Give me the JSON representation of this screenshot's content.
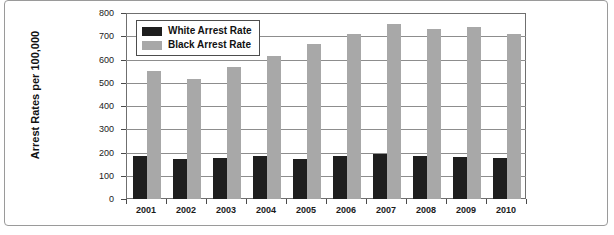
{
  "chart_data": {
    "type": "bar",
    "title": "",
    "xlabel": "",
    "ylabel": "Arrest Rates per 100,000",
    "ylim": [
      0,
      800
    ],
    "ytick_step": 100,
    "yticks": [
      "0",
      "100",
      "200",
      "300",
      "400",
      "500",
      "600",
      "700",
      "800"
    ],
    "grid": true,
    "legend_position": "top-left inside plot",
    "categories": [
      "2001",
      "2002",
      "2003",
      "2004",
      "2005",
      "2006",
      "2007",
      "2008",
      "2009",
      "2010"
    ],
    "series": [
      {
        "name": "White Arrest Rate",
        "color": "#1e1e1e",
        "values": [
          188,
          172,
          179,
          185,
          175,
          188,
          193,
          184,
          180,
          176
        ]
      },
      {
        "name": "Black Arrest Rate",
        "color": "#a8a8a8",
        "values": [
          552,
          518,
          569,
          617,
          672,
          714,
          756,
          735,
          743,
          714
        ]
      }
    ]
  },
  "legend": {
    "items": [
      {
        "label": "White Arrest Rate",
        "swatch": "black-swatch"
      },
      {
        "label": "Black Arrest Rate",
        "swatch": "gray-swatch"
      }
    ]
  }
}
